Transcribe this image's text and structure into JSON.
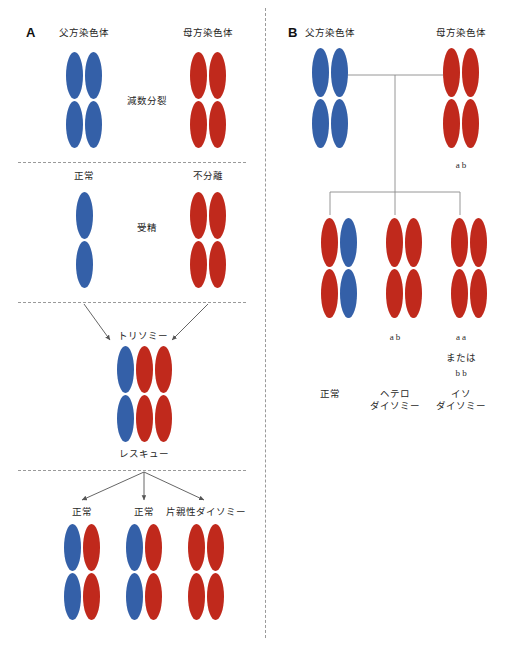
{
  "figure": {
    "panels": [
      {
        "letter": "A",
        "stages": [
          {
            "name": "meiosis",
            "process_label": "減数分裂",
            "parents": [
              {
                "label": "父方染色体",
                "color": "#3460A8",
                "chromatids": 2
              },
              {
                "label": "母方染色体",
                "color": "#C0291C",
                "chromatids": 2
              }
            ]
          },
          {
            "name": "fertilization",
            "process_label": "受精",
            "gametes": [
              {
                "label": "正常",
                "color": "#3460A8",
                "chromatids": 1
              },
              {
                "label": "不分離",
                "color": "#C0291C",
                "chromatids": 2
              }
            ]
          },
          {
            "name": "trisomy",
            "process_label": "トリソミー",
            "cell": {
              "colors": [
                "#3460A8",
                "#C0291C",
                "#C0291C"
              ]
            }
          },
          {
            "name": "rescue",
            "process_label": "レスキュー",
            "outcomes": [
              {
                "label": "正常",
                "colors": [
                  "#3460A8",
                  "#C0291C"
                ]
              },
              {
                "label": "正常",
                "colors": [
                  "#3460A8",
                  "#C0291C"
                ]
              },
              {
                "label": "片親性ダイソミー",
                "colors": [
                  "#C0291C",
                  "#C0291C"
                ]
              }
            ]
          }
        ]
      },
      {
        "letter": "B",
        "parents": [
          {
            "label": "父方染色体",
            "color": "#3460A8",
            "chromatids": 2,
            "alleles": ""
          },
          {
            "label": "母方染色体",
            "color": "#C0291C",
            "chromatids": 2,
            "alleles": "a  b"
          }
        ],
        "outcomes": [
          {
            "label": "正常",
            "colors": [
              "#C0291C",
              "#3460A8"
            ],
            "alleles": "",
            "alleles_alt_sep": "",
            "alleles_alt": ""
          },
          {
            "label": "ヘテロ\nダイソミー",
            "label_line1": "ヘテロ",
            "label_line2": "ダイソミー",
            "colors": [
              "#C0291C",
              "#C0291C"
            ],
            "alleles": "a  b",
            "alleles_alt_sep": "",
            "alleles_alt": ""
          },
          {
            "label": "イソ\nダイソミー",
            "label_line1": "イソ",
            "label_line2": "ダイソミー",
            "colors": [
              "#C0291C",
              "#C0291C"
            ],
            "alleles": "a  a",
            "alleles_alt_sep": "または",
            "alleles_alt": "b  b"
          }
        ]
      }
    ],
    "colors": {
      "paternal": "#3460A8",
      "maternal": "#C0291C",
      "divider": "#9a9a9a",
      "connector": "#8a8a8a",
      "arrow": "#555555"
    }
  }
}
